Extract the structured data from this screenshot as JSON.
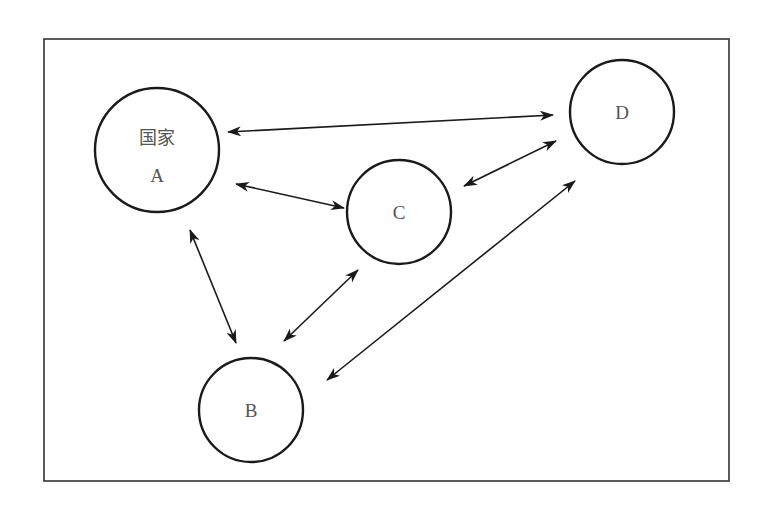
{
  "diagram": {
    "frame": {
      "x": 44,
      "y": 39,
      "width": 685,
      "height": 442,
      "stroke": "#333333"
    },
    "colors": {
      "stroke": "#1a1a1a",
      "label": "#555555",
      "background": "#ffffff"
    },
    "nodes": [
      {
        "id": "A",
        "title": "国家",
        "label": "A",
        "cx": 157,
        "cy": 150,
        "r": 62
      },
      {
        "id": "B",
        "title": "",
        "label": "B",
        "cx": 251,
        "cy": 410,
        "r": 52
      },
      {
        "id": "C",
        "title": "",
        "label": "C",
        "cx": 399,
        "cy": 212,
        "r": 52
      },
      {
        "id": "D",
        "title": "",
        "label": "D",
        "cx": 622,
        "cy": 112,
        "r": 52
      }
    ],
    "edges": [
      {
        "from": "A",
        "to": "D",
        "type": "bidirectional",
        "x1": 228,
        "y1": 132,
        "x2": 553,
        "y2": 115
      },
      {
        "from": "A",
        "to": "C",
        "type": "bidirectional",
        "x1": 236,
        "y1": 184,
        "x2": 344,
        "y2": 208
      },
      {
        "from": "C",
        "to": "D",
        "type": "bidirectional",
        "x1": 464,
        "y1": 186,
        "x2": 556,
        "y2": 141
      },
      {
        "from": "A",
        "to": "B",
        "type": "bidirectional",
        "x1": 190,
        "y1": 230,
        "x2": 236,
        "y2": 343
      },
      {
        "from": "B",
        "to": "C",
        "type": "bidirectional",
        "x1": 284,
        "y1": 341,
        "x2": 358,
        "y2": 270
      },
      {
        "from": "B",
        "to": "D",
        "type": "bidirectional",
        "x1": 327,
        "y1": 380,
        "x2": 575,
        "y2": 181
      }
    ]
  }
}
